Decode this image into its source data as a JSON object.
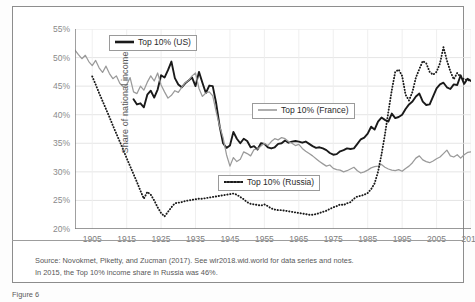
{
  "figure": {
    "caption_stub": "Figure 6"
  },
  "axes": {
    "y_title": "Share of national income (%)",
    "y_ticks": [
      "20%",
      "25%",
      "30%",
      "35%",
      "40%",
      "45%",
      "50%",
      "55%"
    ],
    "x_ticks": [
      "1905",
      "1915",
      "1925",
      "1935",
      "1945",
      "1955",
      "1965",
      "1975",
      "1985",
      "1995",
      "2005",
      "2015"
    ]
  },
  "legend": [
    {
      "label": "Top 10% (US)",
      "style": "solid-thick",
      "color": "#1a1a1a"
    },
    {
      "label": "Top 10% (France)",
      "style": "solid-thin",
      "color": "#9a9a9a"
    },
    {
      "label": "Top 10% (Russia)",
      "style": "dotted",
      "color": "#1a1a1a"
    }
  ],
  "notes": [
    "Source: Novokmet, Piketty, and Zucman (2017). See wir2018.wid.world for data series and notes.",
    "In 2015, the Top 10% income share in Russia was 46%."
  ],
  "chart_data": {
    "type": "line",
    "title": "",
    "xlabel": "",
    "ylabel": "Share of national income (%)",
    "xlim": [
      1900,
      2015
    ],
    "ylim": [
      20,
      55
    ],
    "ytick_step": 5,
    "xtick_step": 10,
    "grid": true,
    "legend_position": "inside",
    "series": [
      {
        "name": "Top 10% (US)",
        "style": "solid-thick",
        "color": "#1a1a1a",
        "x": [
          1917,
          1918,
          1919,
          1920,
          1921,
          1922,
          1923,
          1924,
          1925,
          1926,
          1927,
          1928,
          1929,
          1930,
          1931,
          1932,
          1933,
          1934,
          1935,
          1936,
          1937,
          1938,
          1939,
          1940,
          1941,
          1942,
          1943,
          1944,
          1945,
          1946,
          1947,
          1948,
          1949,
          1950,
          1951,
          1952,
          1953,
          1954,
          1955,
          1956,
          1957,
          1958,
          1959,
          1960,
          1961,
          1962,
          1963,
          1964,
          1965,
          1966,
          1967,
          1968,
          1969,
          1970,
          1971,
          1972,
          1973,
          1974,
          1975,
          1976,
          1977,
          1978,
          1979,
          1980,
          1981,
          1982,
          1983,
          1984,
          1985,
          1986,
          1987,
          1988,
          1989,
          1990,
          1991,
          1992,
          1993,
          1994,
          1995,
          1996,
          1997,
          1998,
          1999,
          2000,
          2001,
          2002,
          2003,
          2004,
          2005,
          2006,
          2007,
          2008,
          2009,
          2010,
          2011,
          2012,
          2013,
          2014,
          2015
        ],
        "y": [
          42.7,
          41.8,
          42.0,
          41.3,
          43.5,
          44.2,
          43.0,
          44.4,
          46.9,
          46.5,
          47.8,
          49.3,
          46.4,
          45.3,
          44.8,
          45.5,
          46.0,
          46.5,
          45.0,
          47.5,
          45.6,
          43.8,
          45.1,
          45.0,
          42.0,
          38.0,
          35.0,
          34.2,
          34.6,
          37.0,
          35.8,
          35.0,
          35.8,
          35.4,
          34.3,
          34.5,
          33.9,
          35.0,
          34.9,
          34.3,
          34.1,
          34.3,
          34.9,
          35.0,
          35.5,
          35.1,
          35.3,
          35.4,
          35.3,
          35.1,
          35.3,
          34.9,
          34.5,
          34.2,
          34.3,
          34.1,
          33.8,
          33.3,
          33.0,
          33.1,
          33.6,
          33.8,
          34.1,
          34.0,
          34.1,
          34.9,
          35.7,
          36.0,
          36.7,
          37.9,
          37.4,
          38.8,
          39.5,
          39.1,
          38.8,
          40.2,
          39.4,
          39.6,
          40.0,
          41.0,
          41.8,
          42.3,
          43.2,
          43.7,
          42.3,
          41.7,
          41.8,
          43.2,
          44.6,
          45.3,
          45.6,
          44.8,
          44.5,
          45.3,
          45.2,
          46.9,
          45.4,
          46.3,
          45.9
        ]
      },
      {
        "name": "Top 10% (France)",
        "style": "solid-thin",
        "color": "#9a9a9a",
        "x": [
          1900,
          1901,
          1902,
          1903,
          1904,
          1905,
          1906,
          1907,
          1908,
          1909,
          1910,
          1911,
          1912,
          1913,
          1914,
          1915,
          1916,
          1917,
          1918,
          1919,
          1920,
          1921,
          1922,
          1923,
          1924,
          1925,
          1926,
          1927,
          1928,
          1929,
          1930,
          1931,
          1932,
          1933,
          1934,
          1935,
          1936,
          1937,
          1938,
          1939,
          1940,
          1941,
          1942,
          1943,
          1944,
          1945,
          1946,
          1947,
          1948,
          1949,
          1950,
          1951,
          1952,
          1953,
          1954,
          1955,
          1956,
          1957,
          1958,
          1959,
          1960,
          1961,
          1962,
          1963,
          1964,
          1965,
          1966,
          1967,
          1968,
          1969,
          1970,
          1971,
          1972,
          1973,
          1974,
          1975,
          1976,
          1977,
          1978,
          1979,
          1980,
          1981,
          1982,
          1983,
          1984,
          1985,
          1986,
          1987,
          1988,
          1989,
          1990,
          1991,
          1992,
          1993,
          1994,
          1995,
          1996,
          1997,
          1998,
          1999,
          2000,
          2001,
          2002,
          2003,
          2004,
          2005,
          2006,
          2007,
          2008,
          2009,
          2010,
          2011,
          2012,
          2013,
          2014,
          2015
        ],
        "y": [
          51.3,
          50.5,
          49.8,
          50.4,
          49.3,
          48.6,
          49.5,
          48.2,
          47.4,
          48.5,
          47.2,
          46.3,
          46.8,
          45.5,
          44.9,
          45.2,
          46.5,
          44.0,
          43.7,
          45.0,
          44.3,
          45.7,
          46.8,
          45.9,
          47.3,
          45.2,
          44.0,
          42.9,
          43.4,
          44.2,
          43.9,
          44.8,
          45.6,
          46.0,
          46.8,
          47.3,
          44.6,
          43.2,
          43.8,
          44.0,
          43.3,
          40.5,
          38.0,
          36.0,
          33.0,
          31.0,
          32.5,
          31.8,
          32.2,
          33.5,
          33.2,
          32.8,
          33.9,
          34.0,
          34.5,
          35.0,
          34.6,
          35.3,
          35.8,
          35.6,
          36.0,
          35.8,
          35.3,
          35.0,
          34.6,
          34.8,
          34.1,
          33.6,
          33.2,
          32.8,
          32.3,
          31.8,
          31.4,
          31.0,
          31.2,
          30.6,
          30.4,
          30.3,
          30.0,
          30.2,
          30.5,
          30.8,
          30.2,
          29.8,
          30.0,
          30.3,
          30.7,
          30.9,
          31.0,
          31.3,
          30.8,
          30.5,
          30.3,
          30.2,
          30.4,
          30.1,
          30.6,
          31.0,
          31.6,
          32.4,
          32.8,
          32.1,
          31.8,
          31.6,
          31.9,
          32.3,
          32.6,
          33.2,
          33.8,
          32.8,
          32.6,
          33.0,
          32.4,
          33.0,
          33.4,
          33.5
        ]
      },
      {
        "name": "Top 10% (Russia)",
        "style": "dotted",
        "color": "#1a1a1a",
        "x": [
          1905,
          1906,
          1907,
          1908,
          1909,
          1910,
          1911,
          1912,
          1913,
          1914,
          1915,
          1916,
          1917,
          1918,
          1919,
          1920,
          1921,
          1922,
          1923,
          1924,
          1925,
          1926,
          1927,
          1928,
          1929,
          1930,
          1931,
          1932,
          1933,
          1934,
          1935,
          1936,
          1937,
          1938,
          1939,
          1940,
          1941,
          1942,
          1943,
          1944,
          1945,
          1946,
          1947,
          1948,
          1949,
          1950,
          1951,
          1952,
          1953,
          1954,
          1955,
          1956,
          1957,
          1958,
          1959,
          1960,
          1961,
          1962,
          1963,
          1964,
          1965,
          1966,
          1967,
          1968,
          1969,
          1970,
          1971,
          1972,
          1973,
          1974,
          1975,
          1976,
          1977,
          1978,
          1979,
          1980,
          1981,
          1982,
          1983,
          1984,
          1985,
          1986,
          1987,
          1988,
          1989,
          1990,
          1991,
          1992,
          1993,
          1994,
          1995,
          1996,
          1997,
          1998,
          1999,
          2000,
          2001,
          2002,
          2003,
          2004,
          2005,
          2006,
          2007,
          2008,
          2009,
          2010,
          2011,
          2012,
          2013,
          2014,
          2015
        ],
        "y": [
          46.7,
          45.3,
          43.8,
          42.4,
          41.0,
          39.6,
          38.1,
          36.7,
          35.3,
          33.9,
          32.4,
          31.0,
          29.6,
          28.2,
          26.7,
          25.3,
          26.5,
          26.0,
          25.0,
          23.8,
          22.8,
          22.2,
          23.0,
          23.8,
          24.5,
          24.6,
          24.7,
          24.9,
          25.0,
          25.1,
          25.2,
          25.3,
          25.3,
          25.4,
          25.5,
          25.6,
          25.7,
          25.8,
          25.9,
          26.0,
          26.1,
          26.2,
          26.0,
          25.6,
          25.2,
          24.7,
          24.4,
          24.3,
          24.2,
          24.1,
          24.3,
          24.0,
          23.6,
          23.4,
          23.3,
          23.3,
          23.2,
          23.1,
          23.0,
          22.9,
          22.8,
          22.7,
          22.6,
          22.5,
          22.5,
          22.6,
          22.8,
          23.0,
          23.2,
          23.5,
          23.8,
          24.0,
          24.3,
          24.2,
          24.5,
          24.7,
          25.3,
          25.7,
          25.8,
          26.0,
          26.3,
          27.0,
          28.0,
          30.0,
          33.0,
          36.5,
          40.5,
          44.3,
          47.5,
          47.9,
          46.8,
          43.5,
          42.5,
          44.0,
          46.5,
          48.0,
          49.4,
          49.0,
          47.5,
          47.0,
          47.5,
          49.0,
          51.8,
          49.5,
          47.6,
          46.2,
          47.3,
          46.6,
          46.2,
          46.1,
          45.9
        ]
      }
    ]
  }
}
